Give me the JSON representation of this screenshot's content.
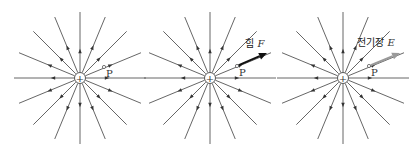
{
  "figure": {
    "line_color": "#555555",
    "num_field_lines": 16,
    "line_length": 66,
    "panels": [
      {
        "id": "panel-1",
        "center": [
          80,
          78
        ],
        "charge_symbol": "+",
        "point_label": "P",
        "point_pos": [
          104,
          67
        ],
        "vector": null
      },
      {
        "id": "panel-2",
        "center": [
          210,
          78
        ],
        "charge_symbol": "+",
        "point_label": "P",
        "point_pos": [
          237,
          66
        ],
        "vector": {
          "label_prefix": "힘",
          "label_symbol": "F",
          "color": "#111111",
          "end": [
            267,
            53
          ],
          "label_pos": [
            245,
            47
          ]
        }
      },
      {
        "id": "panel-3",
        "center": [
          343,
          78
        ],
        "charge_symbol": "+",
        "point_label": "P",
        "point_pos": [
          369,
          66
        ],
        "vector": {
          "label_prefix": "전기장",
          "label_symbol": "E",
          "color": "#9a9a9a",
          "end": [
            400,
            53
          ],
          "label_pos": [
            357,
            46
          ]
        }
      }
    ]
  }
}
